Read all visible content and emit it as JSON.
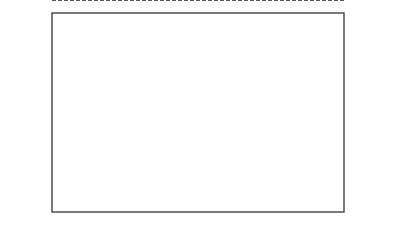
{
  "chart_data": {
    "type": "scatter",
    "title": "",
    "xlabel": "",
    "ylabel": "制動距離（m）",
    "ylim": [
      53.0,
      57.0
    ],
    "yticks": [
      "57.0",
      "56.5",
      "56.0",
      "55.5",
      "55.0",
      "54.5",
      "54.0",
      "53.5",
      "53.0"
    ],
    "xticks": [
      "0",
      "2",
      "4",
      "6"
    ],
    "grid": false,
    "reference_line": {
      "label": "T̄ = 54.8",
      "value": 54.9,
      "style": "dashed"
    },
    "series": [
      {
        "name": "â1",
        "x": 0,
        "values": [
          55.9,
          54.9
        ]
      },
      {
        "name": "â2",
        "x": 2,
        "values": [
          55.0,
          54.85
        ]
      },
      {
        "name": "â3",
        "x": 4,
        "values": [
          54.9,
          54.4
        ]
      },
      {
        "name": "â4",
        "x": 6,
        "values": [
          54.9,
          54.1
        ]
      }
    ],
    "caption": "▲圖 11-3　因子 A（添加劑 %）配合率的水準別平均"
  },
  "labels": {
    "ylabel_chars": [
      "制",
      "動",
      "距",
      "離",
      "︵",
      "m",
      "︶"
    ],
    "caption": "▲圖 11-3　因子 A（添加劑 %）配合率的水準別平均",
    "t_bar": "T",
    "t_value": " = 54.8",
    "a_base": "â",
    "a_subs": [
      "1",
      "2",
      "3",
      "4"
    ]
  }
}
